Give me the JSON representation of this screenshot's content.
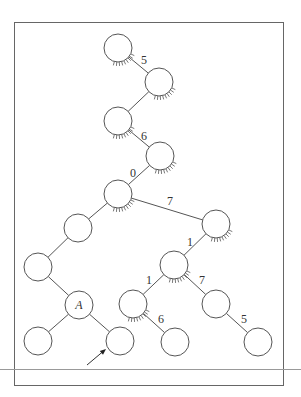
{
  "diagram": {
    "type": "tree",
    "frame": {
      "x": 14,
      "y": 22,
      "w": 269,
      "h": 363
    },
    "baseline": {
      "y": 369
    },
    "colors": {
      "stroke": "#555555",
      "text": "#333333",
      "background": "#ffffff"
    },
    "node_radius": 14,
    "nodes": [
      {
        "id": "n1",
        "x": 118,
        "y": 48,
        "label": "",
        "hatched": true
      },
      {
        "id": "n2",
        "x": 159,
        "y": 82,
        "label": "",
        "hatched": true
      },
      {
        "id": "n3",
        "x": 118,
        "y": 121,
        "label": "",
        "hatched": true
      },
      {
        "id": "n4",
        "x": 160,
        "y": 156,
        "label": "",
        "hatched": true
      },
      {
        "id": "n5",
        "x": 118,
        "y": 194,
        "label": "",
        "hatched": true
      },
      {
        "id": "n6",
        "x": 78,
        "y": 228,
        "label": "",
        "hatched": false
      },
      {
        "id": "n7",
        "x": 38,
        "y": 267,
        "label": "",
        "hatched": false
      },
      {
        "id": "n8",
        "x": 79,
        "y": 305,
        "label": "A",
        "hatched": false
      },
      {
        "id": "n9",
        "x": 38,
        "y": 341,
        "label": "",
        "hatched": false
      },
      {
        "id": "n10",
        "x": 120,
        "y": 341,
        "label": "",
        "hatched": false
      },
      {
        "id": "n11",
        "x": 216,
        "y": 224,
        "label": "",
        "hatched": true
      },
      {
        "id": "n12",
        "x": 174,
        "y": 265,
        "label": "",
        "hatched": true
      },
      {
        "id": "n13",
        "x": 133,
        "y": 304,
        "label": "",
        "hatched": true
      },
      {
        "id": "n14",
        "x": 216,
        "y": 304,
        "label": "",
        "hatched": false
      },
      {
        "id": "n15",
        "x": 175,
        "y": 342,
        "label": "",
        "hatched": false
      },
      {
        "id": "n16",
        "x": 258,
        "y": 342,
        "label": "",
        "hatched": false
      }
    ],
    "edges": [
      {
        "from": "n1",
        "to": "n2",
        "label": "5",
        "lx": 144,
        "ly": 64
      },
      {
        "from": "n2",
        "to": "n3",
        "label": "",
        "lx": 0,
        "ly": 0
      },
      {
        "from": "n3",
        "to": "n4",
        "label": "6",
        "lx": 144,
        "ly": 140
      },
      {
        "from": "n4",
        "to": "n5",
        "label": "0",
        "lx": 133,
        "ly": 177
      },
      {
        "from": "n5",
        "to": "n6",
        "label": "",
        "lx": 0,
        "ly": 0
      },
      {
        "from": "n5",
        "to": "n11",
        "label": "7",
        "lx": 170,
        "ly": 205
      },
      {
        "from": "n6",
        "to": "n7",
        "label": "",
        "lx": 0,
        "ly": 0
      },
      {
        "from": "n7",
        "to": "n8",
        "label": "",
        "lx": 0,
        "ly": 0
      },
      {
        "from": "n8",
        "to": "n9",
        "label": "",
        "lx": 0,
        "ly": 0
      },
      {
        "from": "n8",
        "to": "n10",
        "label": "",
        "lx": 0,
        "ly": 0
      },
      {
        "from": "n11",
        "to": "n12",
        "label": "1",
        "lx": 190,
        "ly": 246
      },
      {
        "from": "n12",
        "to": "n13",
        "label": "1",
        "lx": 149,
        "ly": 284
      },
      {
        "from": "n12",
        "to": "n14",
        "label": "7",
        "lx": 202,
        "ly": 284
      },
      {
        "from": "n13",
        "to": "n15",
        "label": "6",
        "lx": 161,
        "ly": 323
      },
      {
        "from": "n14",
        "to": "n16",
        "label": "5",
        "lx": 244,
        "ly": 323
      }
    ],
    "arrow": {
      "x1": 87,
      "y1": 365,
      "x2": 106,
      "y2": 349
    }
  }
}
